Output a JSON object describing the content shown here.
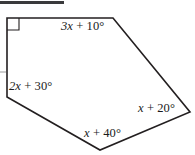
{
  "figure": {
    "name": "pentagon-angle-diagram",
    "top_rule": {
      "color": "#3a3a3c",
      "width_px": 64
    },
    "stroke_color": "#231f20",
    "fill_color": "#ffffff",
    "stroke_width": 1.6,
    "vertices": [
      {
        "name": "top-left",
        "x": 7,
        "y": 18
      },
      {
        "name": "top-right",
        "x": 113,
        "y": 18
      },
      {
        "name": "right",
        "x": 190,
        "y": 112
      },
      {
        "name": "bottom",
        "x": 100,
        "y": 150
      },
      {
        "name": "bottom-left",
        "x": 7,
        "y": 97
      }
    ],
    "right_angle_marker": {
      "label": "right-angle",
      "x": 7,
      "y": 18,
      "size": 12
    },
    "tick_mark": {
      "label": "left-edge-tick",
      "x": 0,
      "y": 72,
      "length": 6
    },
    "labels": {
      "top": {
        "expr": "3x + 10",
        "degree": "°",
        "full": "3x + 10°"
      },
      "left": {
        "expr": "2x + 30",
        "degree": "°",
        "full": "2x + 30°"
      },
      "right": {
        "expr": "x + 20",
        "degree": "°",
        "full": "x + 20°"
      },
      "bottom": {
        "expr": "x + 40",
        "degree": "°",
        "full": "x + 40°"
      }
    }
  }
}
